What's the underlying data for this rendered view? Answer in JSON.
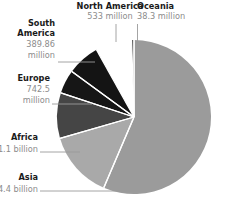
{
  "chart_data": {
    "type": "pie",
    "title": "",
    "subtitle": "",
    "xlabel": "",
    "ylabel": "",
    "legend_position": "none",
    "grid": false,
    "units": "people",
    "total_label": "",
    "categories": [
      "Oceania",
      "Asia",
      "Africa",
      "Europe",
      "South America",
      "North America"
    ],
    "values": [
      38300000,
      4400000000,
      1100000000,
      742500000,
      389860000,
      533000000
    ],
    "value_labels": [
      "38.3 million",
      "4.4 billion",
      "1.1 billion",
      "742.5 million",
      "389.86 million",
      "533 million"
    ],
    "slice_colors": [
      "#2b2b2b",
      "#9b9b9b",
      "#a9a9a9",
      "#454545",
      "#161616",
      "#141414"
    ],
    "start_angle_deg": 0,
    "direction": "clockwise",
    "slices": [
      {
        "name": "Oceania",
        "value": 38300000,
        "value_label": "38.3 million",
        "color": "#2b2b2b",
        "start_deg": 358.2,
        "sweep_deg": 1.8,
        "label_lines": [
          "Oceania",
          "38.3 million"
        ]
      },
      {
        "name": "Asia",
        "value": 4400000000,
        "value_label": "4.4 billion",
        "color": "#9b9b9b",
        "start_deg": 0,
        "sweep_deg": 203.1,
        "label_lines": [
          "Asia",
          "4.4 billion"
        ]
      },
      {
        "name": "Africa",
        "value": 1100000000,
        "value_label": "1.1 billion",
        "color": "#a9a9a9",
        "start_deg": 203.1,
        "sweep_deg": 50.8,
        "label_lines": [
          "Africa",
          "1.1 billion"
        ]
      },
      {
        "name": "Europe",
        "value": 742500000,
        "value_label": "742.5 million",
        "color": "#454545",
        "start_deg": 253.9,
        "sweep_deg": 34.3,
        "label_lines": [
          "Europe",
          "742.5",
          "million"
        ]
      },
      {
        "name": "South America",
        "value": 389860000,
        "value_label": "389.86 million",
        "color": "#161616",
        "start_deg": 288.2,
        "sweep_deg": 18.0,
        "label_lines": [
          "South",
          "America",
          "389.86",
          "million"
        ]
      },
      {
        "name": "North America",
        "value": 533000000,
        "value_label": "533 million",
        "color": "#141414",
        "start_deg": 306.2,
        "sweep_deg": 24.6,
        "label_lines": [
          "North America",
          "533 million"
        ]
      }
    ]
  },
  "labels": {
    "north_america": {
      "name": "North America",
      "value": "533 million"
    },
    "oceania": {
      "name": "Oceania",
      "value": "38.3 million"
    },
    "south_america": {
      "name_line1": "South",
      "name_line2": "America",
      "value_line1": "389.86",
      "value_line2": "million"
    },
    "europe": {
      "name": "Europe",
      "value_line1": "742.5",
      "value_line2": "million"
    },
    "africa": {
      "name": "Africa",
      "value": "1.1 billion"
    },
    "asia": {
      "name": "Asia",
      "value": "4.4 billion"
    }
  },
  "colors": {
    "oceania": "#2b2b2b",
    "asia": "#9b9b9b",
    "africa": "#a9a9a9",
    "europe": "#454545",
    "south_america": "#161616",
    "north_america": "#141414",
    "label_name": "#1a1a1a",
    "label_value": "#8c8c8c",
    "leader": "#9a9a9a",
    "divider": "#ffffff",
    "background": "#ffffff"
  }
}
